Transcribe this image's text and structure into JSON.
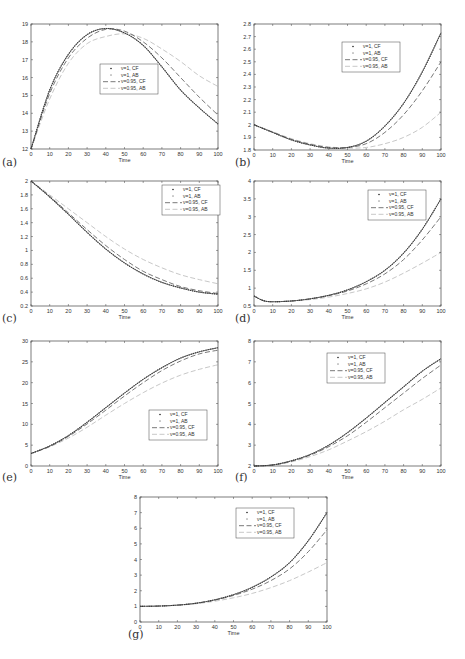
{
  "legend": [
    "ν=1, CF",
    "ν=1, AB",
    "ν=0.95, CF",
    "ν=0.95, AB"
  ],
  "series_styles": [
    {
      "name": "ν=1, CF",
      "color": "#222222",
      "dash": "1,1.2",
      "width": 1.1
    },
    {
      "name": "ν=1, AB",
      "color": "#9a9a9a",
      "dash": "0.8,1.2",
      "width": 1.0
    },
    {
      "name": "ν=0.95, CF",
      "color": "#555555",
      "dash": "5,2.5",
      "width": 0.8
    },
    {
      "name": "ν=0.95, AB",
      "color": "#c8c8c8",
      "dash": "5,2.5",
      "width": 1.0
    }
  ],
  "chart_data": [
    {
      "type": "line",
      "panel": "(a)",
      "xlabel": "Time",
      "ylabel": "",
      "xlim": [
        0,
        100
      ],
      "ylim": [
        12,
        19
      ],
      "xticks": [
        0,
        10,
        20,
        30,
        40,
        50,
        60,
        70,
        80,
        90,
        100
      ],
      "yticks": [
        12,
        13,
        14,
        15,
        16,
        17,
        18,
        19
      ],
      "legend_position": "center",
      "x": [
        0,
        10,
        20,
        30,
        40,
        50,
        60,
        70,
        80,
        90,
        100
      ],
      "series": [
        {
          "name": "ν=1, CF",
          "values": [
            12.0,
            15.3,
            17.3,
            18.4,
            18.75,
            18.5,
            17.8,
            16.6,
            15.3,
            14.3,
            13.4
          ]
        },
        {
          "name": "ν=1, AB",
          "values": [
            12.0,
            15.3,
            17.3,
            18.4,
            18.75,
            18.5,
            17.8,
            16.6,
            15.3,
            14.3,
            13.4
          ]
        },
        {
          "name": "ν=0.95, CF",
          "values": [
            12.0,
            15.1,
            17.1,
            18.2,
            18.7,
            18.6,
            18.0,
            17.1,
            16.0,
            14.9,
            13.9
          ]
        },
        {
          "name": "ν=0.95, AB",
          "values": [
            12.0,
            14.8,
            16.8,
            17.9,
            18.3,
            18.45,
            18.2,
            17.6,
            16.9,
            16.1,
            15.5
          ]
        }
      ]
    },
    {
      "type": "line",
      "panel": "(b)",
      "xlabel": "Time",
      "ylabel": "",
      "xlim": [
        0,
        100
      ],
      "ylim": [
        1.8,
        2.8
      ],
      "xticks": [
        0,
        10,
        20,
        30,
        40,
        50,
        60,
        70,
        80,
        90,
        100
      ],
      "yticks": [
        1.8,
        1.9,
        2.0,
        2.1,
        2.2,
        2.3,
        2.4,
        2.5,
        2.6,
        2.7,
        2.8
      ],
      "legend_position": "upper center",
      "x": [
        0,
        10,
        20,
        30,
        40,
        50,
        60,
        70,
        80,
        90,
        100
      ],
      "series": [
        {
          "name": "ν=1, CF",
          "values": [
            2.0,
            1.94,
            1.88,
            1.84,
            1.815,
            1.82,
            1.87,
            1.99,
            2.17,
            2.42,
            2.73
          ]
        },
        {
          "name": "ν=1, AB",
          "values": [
            2.0,
            1.94,
            1.88,
            1.84,
            1.815,
            1.82,
            1.87,
            1.99,
            2.17,
            2.42,
            2.73
          ]
        },
        {
          "name": "ν=0.95, CF",
          "values": [
            2.0,
            1.94,
            1.885,
            1.845,
            1.82,
            1.82,
            1.85,
            1.94,
            2.08,
            2.27,
            2.5
          ]
        },
        {
          "name": "ν=0.95, AB",
          "values": [
            2.0,
            1.945,
            1.89,
            1.85,
            1.825,
            1.815,
            1.82,
            1.85,
            1.9,
            1.98,
            2.1
          ]
        }
      ]
    },
    {
      "type": "line",
      "panel": "(c)",
      "xlabel": "Time",
      "ylabel": "",
      "xlim": [
        0,
        100
      ],
      "ylim": [
        0.2,
        2
      ],
      "xticks": [
        0,
        10,
        20,
        30,
        40,
        50,
        60,
        70,
        80,
        90,
        100
      ],
      "yticks": [
        0.2,
        0.4,
        0.6,
        0.8,
        1,
        1.2,
        1.4,
        1.6,
        1.8,
        2
      ],
      "legend_position": "upper right",
      "x": [
        0,
        10,
        20,
        30,
        40,
        50,
        60,
        70,
        80,
        90,
        100
      ],
      "series": [
        {
          "name": "ν=1, CF",
          "values": [
            2.0,
            1.77,
            1.52,
            1.26,
            1.02,
            0.82,
            0.66,
            0.54,
            0.46,
            0.4,
            0.37
          ]
        },
        {
          "name": "ν=1, AB",
          "values": [
            2.0,
            1.77,
            1.52,
            1.26,
            1.02,
            0.82,
            0.66,
            0.54,
            0.46,
            0.4,
            0.37
          ]
        },
        {
          "name": "ν=0.95, CF",
          "values": [
            2.0,
            1.78,
            1.54,
            1.3,
            1.07,
            0.87,
            0.7,
            0.58,
            0.48,
            0.42,
            0.38
          ]
        },
        {
          "name": "ν=0.95, AB",
          "values": [
            2.0,
            1.8,
            1.6,
            1.4,
            1.2,
            1.02,
            0.87,
            0.75,
            0.65,
            0.58,
            0.52
          ]
        }
      ]
    },
    {
      "type": "line",
      "panel": "(d)",
      "xlabel": "Time",
      "ylabel": "",
      "xlim": [
        0,
        100
      ],
      "ylim": [
        0.5,
        4
      ],
      "xticks": [
        0,
        10,
        20,
        30,
        40,
        50,
        60,
        70,
        80,
        90,
        100
      ],
      "yticks": [
        0.5,
        1,
        1.5,
        2,
        2.5,
        3,
        3.5,
        4
      ],
      "legend_position": "upper right",
      "x": [
        0,
        5,
        10,
        20,
        30,
        40,
        50,
        60,
        70,
        80,
        90,
        100
      ],
      "series": [
        {
          "name": "ν=1, CF",
          "values": [
            0.78,
            0.65,
            0.62,
            0.64,
            0.7,
            0.8,
            0.95,
            1.18,
            1.5,
            1.98,
            2.65,
            3.5
          ]
        },
        {
          "name": "ν=1, AB",
          "values": [
            0.78,
            0.65,
            0.62,
            0.64,
            0.7,
            0.8,
            0.95,
            1.18,
            1.5,
            1.98,
            2.65,
            3.5
          ]
        },
        {
          "name": "ν=0.95, CF",
          "values": [
            0.78,
            0.65,
            0.62,
            0.64,
            0.7,
            0.79,
            0.92,
            1.12,
            1.4,
            1.8,
            2.35,
            3.0
          ]
        },
        {
          "name": "ν=0.95, AB",
          "values": [
            0.78,
            0.65,
            0.62,
            0.64,
            0.68,
            0.75,
            0.85,
            0.98,
            1.17,
            1.42,
            1.7,
            2.0
          ]
        }
      ]
    },
    {
      "type": "line",
      "panel": "(e)",
      "xlabel": "Time",
      "ylabel": "",
      "xlim": [
        0,
        100
      ],
      "ylim": [
        0,
        30
      ],
      "xticks": [
        0,
        10,
        20,
        30,
        40,
        50,
        60,
        70,
        80,
        90,
        100
      ],
      "yticks": [
        0,
        5,
        10,
        15,
        20,
        25,
        30
      ],
      "legend_position": "center right",
      "x": [
        0,
        10,
        20,
        30,
        40,
        50,
        60,
        70,
        80,
        90,
        100
      ],
      "series": [
        {
          "name": "ν=1, CF",
          "values": [
            3.0,
            4.8,
            7.3,
            10.5,
            14.0,
            17.5,
            20.8,
            23.6,
            25.9,
            27.4,
            28.4
          ]
        },
        {
          "name": "ν=1, AB",
          "values": [
            3.0,
            4.8,
            7.3,
            10.5,
            14.0,
            17.5,
            20.8,
            23.6,
            25.9,
            27.4,
            28.4
          ]
        },
        {
          "name": "ν=0.95, CF",
          "values": [
            3.0,
            4.7,
            7.1,
            10.1,
            13.4,
            16.8,
            20.0,
            22.9,
            25.2,
            26.9,
            27.8
          ]
        },
        {
          "name": "ν=0.95, AB",
          "values": [
            3.0,
            4.6,
            6.7,
            9.3,
            12.2,
            15.0,
            17.6,
            19.9,
            21.8,
            23.2,
            24.3
          ]
        }
      ]
    },
    {
      "type": "line",
      "panel": "(f)",
      "xlabel": "Time",
      "ylabel": "",
      "xlim": [
        0,
        100
      ],
      "ylim": [
        2,
        8
      ],
      "xticks": [
        0,
        10,
        20,
        30,
        40,
        50,
        60,
        70,
        80,
        90,
        100
      ],
      "yticks": [
        2,
        3,
        4,
        5,
        6,
        7,
        8
      ],
      "legend_position": "upper center",
      "x": [
        0,
        10,
        20,
        30,
        40,
        50,
        60,
        70,
        80,
        90,
        100
      ],
      "series": [
        {
          "name": "ν=1, CF",
          "values": [
            2.0,
            2.05,
            2.25,
            2.55,
            3.0,
            3.6,
            4.3,
            5.05,
            5.8,
            6.55,
            7.15
          ]
        },
        {
          "name": "ν=1, AB",
          "values": [
            2.0,
            2.05,
            2.25,
            2.55,
            3.0,
            3.6,
            4.3,
            5.05,
            5.8,
            6.55,
            7.15
          ]
        },
        {
          "name": "ν=0.95, CF",
          "values": [
            2.0,
            2.05,
            2.23,
            2.52,
            2.93,
            3.45,
            4.1,
            4.8,
            5.5,
            6.2,
            6.85
          ]
        },
        {
          "name": "ν=0.95, AB",
          "values": [
            2.0,
            2.05,
            2.2,
            2.45,
            2.78,
            3.2,
            3.65,
            4.15,
            4.7,
            5.2,
            5.75
          ]
        }
      ]
    },
    {
      "type": "line",
      "panel": "(g)",
      "xlabel": "Time",
      "ylabel": "",
      "xlim": [
        0,
        100
      ],
      "ylim": [
        0,
        8
      ],
      "xticks": [
        0,
        10,
        20,
        30,
        40,
        50,
        60,
        70,
        80,
        90,
        100
      ],
      "yticks": [
        0,
        1,
        2,
        3,
        4,
        5,
        6,
        7,
        8
      ],
      "legend_position": "upper right",
      "x": [
        0,
        10,
        20,
        30,
        40,
        50,
        60,
        70,
        80,
        90,
        100
      ],
      "series": [
        {
          "name": "ν=1, CF",
          "values": [
            1.0,
            1.02,
            1.08,
            1.2,
            1.42,
            1.75,
            2.22,
            2.88,
            3.8,
            5.2,
            7.0
          ]
        },
        {
          "name": "ν=1, AB",
          "values": [
            1.0,
            1.02,
            1.08,
            1.2,
            1.42,
            1.75,
            2.22,
            2.88,
            3.8,
            5.2,
            7.0
          ]
        },
        {
          "name": "ν=0.95, CF",
          "values": [
            1.0,
            1.02,
            1.08,
            1.2,
            1.4,
            1.7,
            2.1,
            2.65,
            3.4,
            4.5,
            5.9
          ]
        },
        {
          "name": "ν=0.95, AB",
          "values": [
            1.0,
            1.02,
            1.07,
            1.17,
            1.33,
            1.55,
            1.83,
            2.2,
            2.65,
            3.2,
            3.8
          ]
        }
      ]
    }
  ],
  "layout": [
    {
      "panel": "(a)",
      "x0": 31,
      "x1": 218,
      "y0": 24,
      "y1": 149,
      "legend": [
        100,
        64
      ],
      "label_pos": [
        2,
        166
      ]
    },
    {
      "panel": "(b)",
      "x0": 254,
      "x1": 441,
      "y0": 24,
      "y1": 150,
      "legend": [
        342,
        42
      ],
      "label_pos": [
        235,
        166
      ]
    },
    {
      "panel": "(c)",
      "x0": 31,
      "x1": 218,
      "y0": 181,
      "y1": 306,
      "legend": [
        162,
        185
      ],
      "label_pos": [
        2,
        322
      ]
    },
    {
      "panel": "(d)",
      "x0": 254,
      "x1": 441,
      "y0": 181,
      "y1": 306,
      "legend": [
        368,
        190
      ],
      "label_pos": [
        235,
        322
      ]
    },
    {
      "panel": "(e)",
      "x0": 31,
      "x1": 218,
      "y0": 341,
      "y1": 466,
      "legend": [
        149,
        410
      ],
      "label_pos": [
        2,
        481
      ]
    },
    {
      "panel": "(f)",
      "x0": 254,
      "x1": 441,
      "y0": 341,
      "y1": 466,
      "legend": [
        327,
        353
      ],
      "label_pos": [
        235,
        481
      ]
    },
    {
      "panel": "(g)",
      "x0": 140,
      "x1": 327,
      "y0": 497,
      "y1": 622,
      "legend": [
        236,
        508
      ],
      "label_pos": [
        128,
        638
      ]
    }
  ]
}
